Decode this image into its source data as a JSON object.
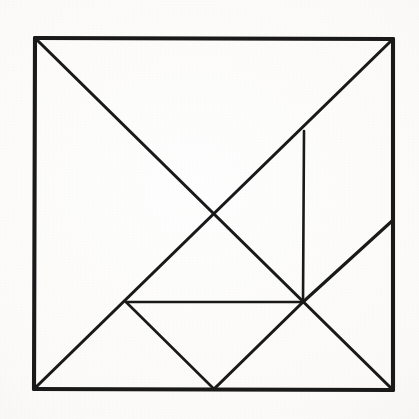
{
  "figure": {
    "kind": "tangram-dissection-diagram",
    "medium": "hand-drawn ink on paper",
    "background_color": "#faf9f7",
    "ink_color": "#1a1a1a",
    "canvas": {
      "width": 419,
      "height": 419
    },
    "outline_stroke_width": 4.1,
    "inner_stroke_width": 3.1,
    "has_labels": false,
    "has_text": false,
    "piece_count": 7
  },
  "geometry": {
    "square_corners": {
      "top_left": [
        35,
        38
      ],
      "top_right": [
        393,
        39
      ],
      "bottom_right": [
        393,
        390
      ],
      "bottom_left": [
        34,
        389
      ]
    },
    "vertices": {
      "A_top_left": [
        35,
        38
      ],
      "B_top_right": [
        393,
        39
      ],
      "C_bottom_right": [
        393,
        390
      ],
      "D_bottom_left": [
        34,
        389
      ],
      "E_center": [
        212,
        214
      ],
      "F_upper_right_mid": [
        304,
        131
      ],
      "G_lower_right_mid": [
        303,
        302
      ],
      "H_right_edge_mid": [
        392,
        221
      ],
      "I_bottom_mid": [
        214,
        389
      ],
      "J_left_lower_mid": [
        126,
        302
      ]
    },
    "segments": [
      {
        "name": "outline-top",
        "from": "A_top_left",
        "to": "B_top_right",
        "weight": "outer"
      },
      {
        "name": "outline-right",
        "from": "B_top_right",
        "to": "C_bottom_right",
        "weight": "outer"
      },
      {
        "name": "outline-bottom",
        "from": "C_bottom_right",
        "to": "D_bottom_left",
        "weight": "outer"
      },
      {
        "name": "outline-left",
        "from": "D_bottom_left",
        "to": "A_top_left",
        "weight": "outer"
      },
      {
        "name": "main-diagonal-tl-br",
        "from": "A_top_left",
        "to": "C_bottom_right",
        "weight": "inner"
      },
      {
        "name": "anti-diagonal-tr-bl",
        "from": "B_top_right",
        "to": "D_bottom_left",
        "weight": "inner"
      },
      {
        "name": "vertical-right-inner",
        "from": "F_upper_right_mid",
        "to": "G_lower_right_mid",
        "weight": "thin"
      },
      {
        "name": "right-edge-to-g",
        "from": "H_right_edge_mid",
        "to": "G_lower_right_mid",
        "weight": "inner"
      },
      {
        "name": "g-to-bottom-mid",
        "from": "G_lower_right_mid",
        "to": "I_bottom_mid",
        "weight": "inner"
      },
      {
        "name": "j-to-bottom-mid",
        "from": "J_left_lower_mid",
        "to": "I_bottom_mid",
        "weight": "thin"
      },
      {
        "name": "j-to-center",
        "from": "J_left_lower_mid",
        "to": "G_lower_right_mid",
        "weight": "thin"
      }
    ],
    "pieces": [
      {
        "name": "large-triangle-left",
        "shape": "right-triangle",
        "points": [
          [
            35,
            38
          ],
          [
            212,
            214
          ],
          [
            34,
            389
          ]
        ]
      },
      {
        "name": "large-triangle-top",
        "shape": "right-triangle",
        "points": [
          [
            35,
            38
          ],
          [
            393,
            39
          ],
          [
            212,
            214
          ]
        ]
      },
      {
        "name": "medium-triangle-right",
        "shape": "right-triangle",
        "points": [
          [
            393,
            39
          ],
          [
            393,
            221
          ],
          [
            303,
            302
          ]
        ]
      },
      {
        "name": "small-triangle-upper",
        "shape": "right-triangle",
        "points": [
          [
            212,
            214
          ],
          [
            304,
            131
          ],
          [
            303,
            302
          ]
        ]
      },
      {
        "name": "small-triangle-lower",
        "shape": "right-triangle",
        "points": [
          [
            126,
            302
          ],
          [
            212,
            214
          ],
          [
            214,
            389
          ]
        ]
      },
      {
        "name": "square-piece",
        "shape": "square",
        "points": [
          [
            212,
            214
          ],
          [
            303,
            302
          ],
          [
            214,
            389
          ],
          [
            126,
            302
          ]
        ]
      },
      {
        "name": "parallelogram-piece",
        "shape": "parallelogram",
        "points": [
          [
            303,
            302
          ],
          [
            392,
            221
          ],
          [
            393,
            390
          ],
          [
            214,
            389
          ]
        ]
      }
    ]
  }
}
